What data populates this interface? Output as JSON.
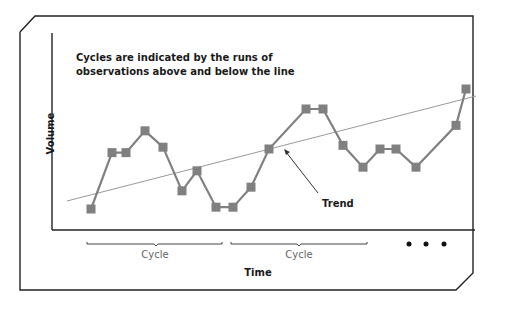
{
  "chart_data": {
    "type": "line",
    "title": "",
    "annotation": "Cycles are indicated by the runs of observations above and below the line",
    "xlabel": "Time",
    "ylabel": "Volume",
    "grid": false,
    "legend": null,
    "series": [
      {
        "name": "Observations",
        "marker": "square",
        "color": "#808080",
        "x": [
          1,
          2,
          3,
          4,
          5,
          6,
          7,
          8,
          9,
          10,
          11,
          12,
          13,
          14,
          15,
          16,
          17,
          18,
          19,
          20
        ],
        "values": [
          10,
          41,
          41,
          53,
          44,
          20,
          31,
          11,
          11,
          22,
          43,
          65,
          65,
          45,
          33,
          43,
          43,
          33,
          56,
          76
        ]
      },
      {
        "name": "Trend",
        "type": "linear",
        "color": "#999999",
        "start": [
          0,
          16
        ],
        "end": [
          21,
          69
        ]
      }
    ],
    "annotations": [
      {
        "text": "Trend",
        "arrow_to": "trend-line"
      },
      {
        "text": "Cycle",
        "span": "first bracket"
      },
      {
        "text": "Cycle",
        "span": "second bracket"
      },
      {
        "text": "• • •",
        "meaning": "continuation"
      }
    ]
  },
  "labels": {
    "caption": "Cycles are indicated by the runs of observations above and below the line",
    "ylabel": "Volume",
    "xlabel": "Time",
    "trend": "Trend",
    "cycle1": "Cycle",
    "cycle2": "Cycle"
  }
}
